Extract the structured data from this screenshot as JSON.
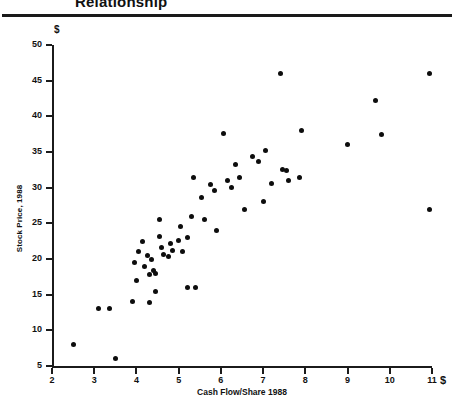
{
  "title": {
    "text": "Relationship",
    "note": "top-cropped heading"
  },
  "axes": {
    "y_currency_symbol": "$",
    "x_currency_symbol": "$",
    "y_axis_title": "Stock Price, 1988",
    "x_axis_title": "Cash Flow/Share 1988",
    "y_ticks": [
      "5",
      "10",
      "15",
      "20",
      "25",
      "30",
      "35",
      "40",
      "45",
      "50"
    ],
    "x_ticks": [
      "2",
      "3",
      "4",
      "5",
      "6",
      "7",
      "8",
      "9",
      "10",
      "11"
    ]
  },
  "chart_data": {
    "type": "scatter",
    "title": "Relationship",
    "xlabel": "Cash Flow/Share 1988",
    "ylabel": "Stock Price, 1988",
    "xlim": [
      2,
      11
    ],
    "ylim": [
      5,
      50
    ],
    "xtick_step": 1,
    "ytick_step": 5,
    "grid": false,
    "legend": "none",
    "marker": "filled-circle",
    "marker_color": "#0d0d0d",
    "series": [
      {
        "name": "Companies",
        "points": [
          [
            2.5,
            8.0
          ],
          [
            3.5,
            6.0
          ],
          [
            3.1,
            13.0
          ],
          [
            3.35,
            13.0
          ],
          [
            3.9,
            14.0
          ],
          [
            4.0,
            17.0
          ],
          [
            4.3,
            13.9
          ],
          [
            4.45,
            15.5
          ],
          [
            3.95,
            19.5
          ],
          [
            4.2,
            19.0
          ],
          [
            4.25,
            20.5
          ],
          [
            4.35,
            20.0
          ],
          [
            4.4,
            18.4
          ],
          [
            4.45,
            18.0
          ],
          [
            4.3,
            17.8
          ],
          [
            4.15,
            22.4
          ],
          [
            4.05,
            21.0
          ],
          [
            4.55,
            23.2
          ],
          [
            4.6,
            21.6
          ],
          [
            4.65,
            20.6
          ],
          [
            4.75,
            20.4
          ],
          [
            4.8,
            22.2
          ],
          [
            4.85,
            21.2
          ],
          [
            4.55,
            25.6
          ],
          [
            5.0,
            22.6
          ],
          [
            5.05,
            24.6
          ],
          [
            5.1,
            21.0
          ],
          [
            5.2,
            16.0
          ],
          [
            5.4,
            16.0
          ],
          [
            5.2,
            23.0
          ],
          [
            5.3,
            26.0
          ],
          [
            5.35,
            31.4
          ],
          [
            5.55,
            28.6
          ],
          [
            5.6,
            25.6
          ],
          [
            5.75,
            30.4
          ],
          [
            5.85,
            29.6
          ],
          [
            5.9,
            24.0
          ],
          [
            6.05,
            37.6
          ],
          [
            6.15,
            31.0
          ],
          [
            6.25,
            30.0
          ],
          [
            6.35,
            33.2
          ],
          [
            6.45,
            31.4
          ],
          [
            6.55,
            27.0
          ],
          [
            6.75,
            34.4
          ],
          [
            6.9,
            33.6
          ],
          [
            7.0,
            28.0
          ],
          [
            7.05,
            35.2
          ],
          [
            7.2,
            30.6
          ],
          [
            7.4,
            46.0
          ],
          [
            7.45,
            32.6
          ],
          [
            7.55,
            32.4
          ],
          [
            7.6,
            31.0
          ],
          [
            7.9,
            38.0
          ],
          [
            7.85,
            31.4
          ],
          [
            9.0,
            36.0
          ],
          [
            9.65,
            42.2
          ],
          [
            9.8,
            37.4
          ],
          [
            10.95,
            46.0
          ],
          [
            10.95,
            27.0
          ]
        ]
      }
    ]
  },
  "geometry": {
    "x_min_px": 52,
    "x_max_px": 432,
    "y_min_px": 348,
    "y_max_px": 27
  }
}
